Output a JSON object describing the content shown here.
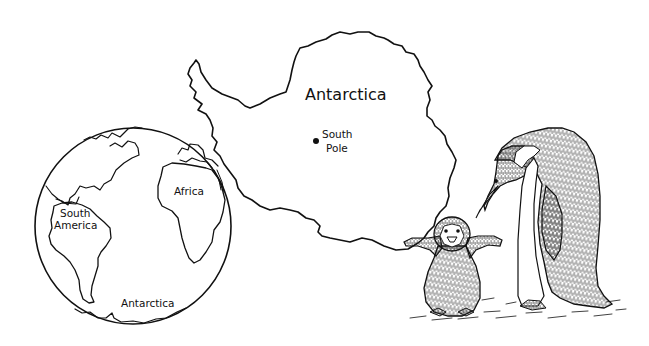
{
  "illustration": {
    "background": "#ffffff",
    "ink_color": "#111111",
    "antarctica_map": {
      "title": "Antarctica",
      "marker": {
        "label_line1": "South",
        "label_line2": "Pole"
      }
    },
    "globe": {
      "labels": {
        "africa": "Africa",
        "south_america_line1": "South",
        "south_america_line2": "America",
        "antarctica": "Antarctica"
      }
    },
    "penguins": {
      "adult": "emperor penguin (adult, bending down)",
      "chick": "penguin chick (flippers raised)"
    }
  }
}
